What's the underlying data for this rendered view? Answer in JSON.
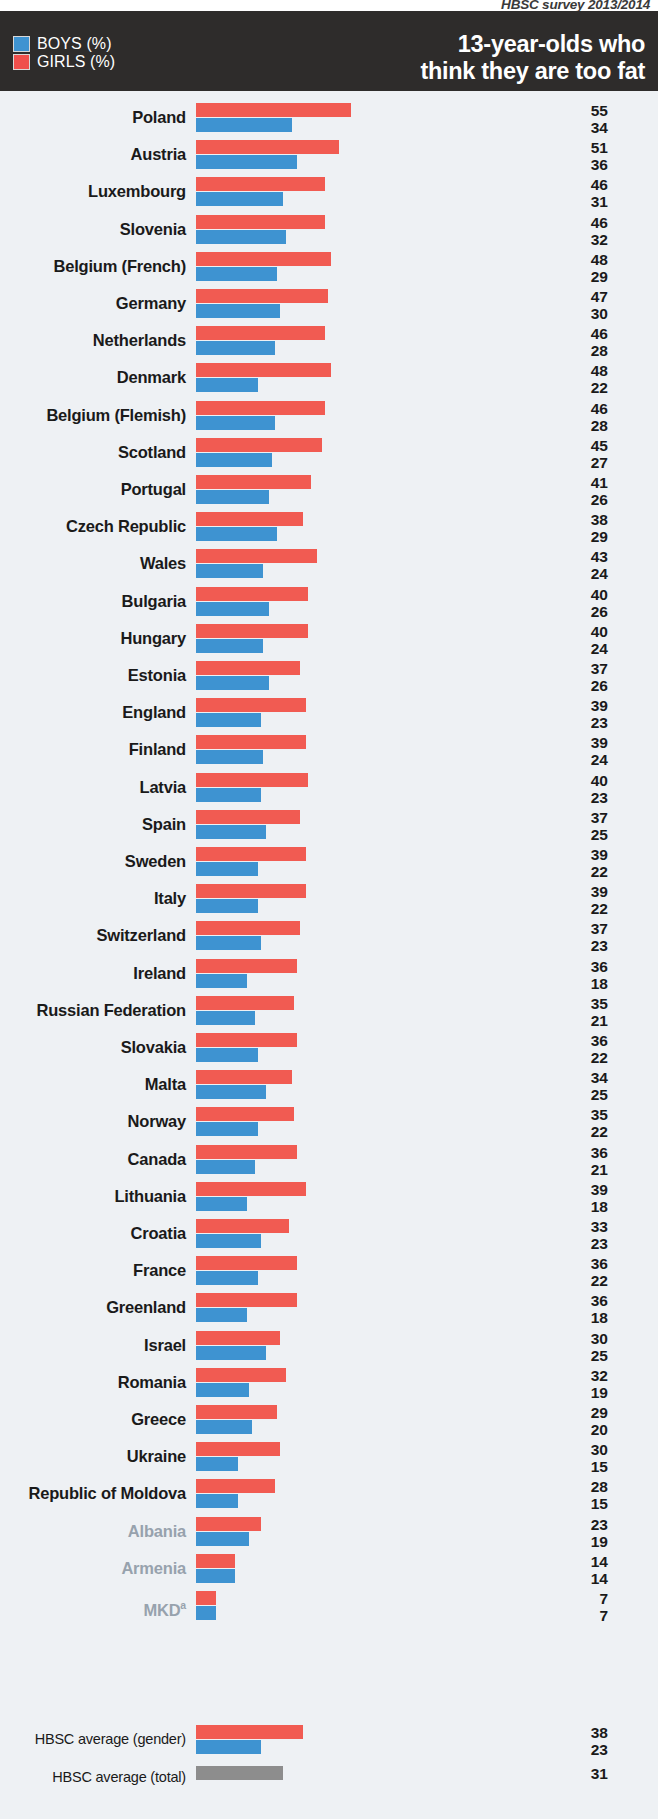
{
  "source_note": "HBSC survey 2013/2014",
  "header": {
    "title_line1": "13-year-olds who",
    "title_line2": "think they are too fat",
    "legend": [
      {
        "key": "boys",
        "label": "BOYS (%)",
        "color": "#3e93d1"
      },
      {
        "key": "girls",
        "label": "GIRLS (%)",
        "color": "#f15b52"
      }
    ]
  },
  "chart_data": {
    "type": "bar",
    "orientation": "horizontal",
    "title": "13-year-olds who think they are too fat",
    "subtitle": "HBSC survey 2013/2014",
    "xlabel": "",
    "ylabel": "",
    "xlim": [
      0,
      55
    ],
    "grid": false,
    "legend_position": "top-left",
    "series": [
      {
        "name": "GIRLS (%)",
        "color": "#f15b52"
      },
      {
        "name": "BOYS (%)",
        "color": "#3e93d1"
      }
    ],
    "categories": [
      "Poland",
      "Austria",
      "Luxembourg",
      "Slovenia",
      "Belgium (French)",
      "Germany",
      "Netherlands",
      "Denmark",
      "Belgium (Flemish)",
      "Scotland",
      "Portugal",
      "Czech Republic",
      "Wales",
      "Bulgaria",
      "Hungary",
      "Estonia",
      "England",
      "Finland",
      "Latvia",
      "Spain",
      "Sweden",
      "Italy",
      "Switzerland",
      "Ireland",
      "Russian Federation",
      "Slovakia",
      "Malta",
      "Norway",
      "Canada",
      "Lithuania",
      "Croatia",
      "France",
      "Greenland",
      "Israel",
      "Romania",
      "Greece",
      "Ukraine",
      "Republic of Moldova",
      "Albania",
      "Armenia",
      "MKD"
    ],
    "girls": [
      55,
      51,
      46,
      46,
      48,
      47,
      46,
      48,
      46,
      45,
      41,
      38,
      43,
      40,
      40,
      37,
      39,
      39,
      40,
      37,
      39,
      39,
      37,
      36,
      35,
      36,
      34,
      35,
      36,
      39,
      33,
      36,
      36,
      30,
      32,
      29,
      30,
      28,
      23,
      14,
      7
    ],
    "boys": [
      34,
      36,
      31,
      32,
      29,
      30,
      28,
      22,
      28,
      27,
      26,
      29,
      24,
      26,
      24,
      26,
      23,
      24,
      23,
      25,
      22,
      22,
      23,
      18,
      21,
      22,
      25,
      22,
      21,
      18,
      23,
      22,
      18,
      25,
      19,
      20,
      15,
      15,
      19,
      14,
      7
    ],
    "averages": {
      "gender_label": "HBSC average (gender)",
      "gender_girls": 38,
      "gender_boys": 23,
      "total_label": "HBSC average (total)",
      "total_value": 31
    }
  },
  "rows": [
    {
      "label": "Poland",
      "girls": 55,
      "boys": 34,
      "faded": false
    },
    {
      "label": "Austria",
      "girls": 51,
      "boys": 36,
      "faded": false
    },
    {
      "label": "Luxembourg",
      "girls": 46,
      "boys": 31,
      "faded": false
    },
    {
      "label": "Slovenia",
      "girls": 46,
      "boys": 32,
      "faded": false
    },
    {
      "label": "Belgium (French)",
      "girls": 48,
      "boys": 29,
      "faded": false
    },
    {
      "label": "Germany",
      "girls": 47,
      "boys": 30,
      "faded": false
    },
    {
      "label": "Netherlands",
      "girls": 46,
      "boys": 28,
      "faded": false
    },
    {
      "label": "Denmark",
      "girls": 48,
      "boys": 22,
      "faded": false
    },
    {
      "label": "Belgium (Flemish)",
      "girls": 46,
      "boys": 28,
      "faded": false
    },
    {
      "label": "Scotland",
      "girls": 45,
      "boys": 27,
      "faded": false
    },
    {
      "label": "Portugal",
      "girls": 41,
      "boys": 26,
      "faded": false
    },
    {
      "label": "Czech Republic",
      "girls": 38,
      "boys": 29,
      "faded": false
    },
    {
      "label": "Wales",
      "girls": 43,
      "boys": 24,
      "faded": false
    },
    {
      "label": "Bulgaria",
      "girls": 40,
      "boys": 26,
      "faded": false
    },
    {
      "label": "Hungary",
      "girls": 40,
      "boys": 24,
      "faded": false
    },
    {
      "label": "Estonia",
      "girls": 37,
      "boys": 26,
      "faded": false
    },
    {
      "label": "England",
      "girls": 39,
      "boys": 23,
      "faded": false
    },
    {
      "label": "Finland",
      "girls": 39,
      "boys": 24,
      "faded": false
    },
    {
      "label": "Latvia",
      "girls": 40,
      "boys": 23,
      "faded": false
    },
    {
      "label": "Spain",
      "girls": 37,
      "boys": 25,
      "faded": false
    },
    {
      "label": "Sweden",
      "girls": 39,
      "boys": 22,
      "faded": false
    },
    {
      "label": "Italy",
      "girls": 39,
      "boys": 22,
      "faded": false
    },
    {
      "label": "Switzerland",
      "girls": 37,
      "boys": 23,
      "faded": false
    },
    {
      "label": "Ireland",
      "girls": 36,
      "boys": 18,
      "faded": false
    },
    {
      "label": "Russian Federation",
      "girls": 35,
      "boys": 21,
      "faded": false
    },
    {
      "label": "Slovakia",
      "girls": 36,
      "boys": 22,
      "faded": false
    },
    {
      "label": "Malta",
      "girls": 34,
      "boys": 25,
      "faded": false
    },
    {
      "label": "Norway",
      "girls": 35,
      "boys": 22,
      "faded": false
    },
    {
      "label": "Canada",
      "girls": 36,
      "boys": 21,
      "faded": false
    },
    {
      "label": "Lithuania",
      "girls": 39,
      "boys": 18,
      "faded": false
    },
    {
      "label": "Croatia",
      "girls": 33,
      "boys": 23,
      "faded": false
    },
    {
      "label": "France",
      "girls": 36,
      "boys": 22,
      "faded": false
    },
    {
      "label": "Greenland",
      "girls": 36,
      "boys": 18,
      "faded": false
    },
    {
      "label": "Israel",
      "girls": 30,
      "boys": 25,
      "faded": false
    },
    {
      "label": "Romania",
      "girls": 32,
      "boys": 19,
      "faded": false
    },
    {
      "label": "Greece",
      "girls": 29,
      "boys": 20,
      "faded": false
    },
    {
      "label": "Ukraine",
      "girls": 30,
      "boys": 15,
      "faded": false
    },
    {
      "label": "Republic of Moldova",
      "girls": 28,
      "boys": 15,
      "faded": false
    },
    {
      "label": "Albania",
      "girls": 23,
      "boys": 19,
      "faded": true
    },
    {
      "label": "Armenia",
      "girls": 14,
      "boys": 14,
      "faded": true
    },
    {
      "label": "MKD",
      "girls": 7,
      "boys": 7,
      "faded": true,
      "superscript": "a"
    }
  ],
  "footer": {
    "gender_average": {
      "label": "HBSC average (gender)",
      "girls": 38,
      "boys": 23
    },
    "total_average": {
      "label": "HBSC average (total)",
      "value": 31
    }
  }
}
